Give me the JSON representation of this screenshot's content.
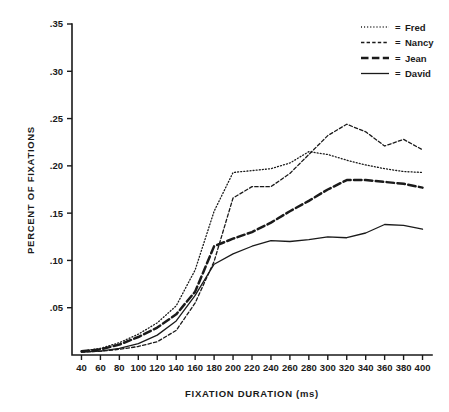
{
  "chart_data": {
    "type": "line",
    "title": "",
    "xlabel": "FIXATION DURATION (ms)",
    "ylabel": "PERCENT OF FIXATIONS",
    "xlim": [
      30,
      410
    ],
    "ylim": [
      0,
      0.35
    ],
    "grid": false,
    "legend_position": "top-right",
    "legend_prefix": "=",
    "x": [
      40,
      60,
      80,
      100,
      120,
      140,
      160,
      180,
      200,
      220,
      240,
      260,
      280,
      300,
      320,
      340,
      360,
      380,
      400
    ],
    "xticks": [
      "40",
      "60",
      "80",
      "100",
      "120",
      "140",
      "160",
      "180",
      "200",
      "220",
      "240",
      "260",
      "280",
      "300",
      "320",
      "340",
      "360",
      "380",
      "400"
    ],
    "yticks": [
      ".05",
      ".10",
      ".15",
      ".20",
      ".25",
      ".30",
      ".35"
    ],
    "ytick_values": [
      0.05,
      0.1,
      0.15,
      0.2,
      0.25,
      0.3,
      0.35
    ],
    "series": [
      {
        "name": "Fred",
        "style": "dotted",
        "values": [
          0.004,
          0.007,
          0.013,
          0.022,
          0.034,
          0.052,
          0.09,
          0.152,
          0.193,
          0.195,
          0.197,
          0.203,
          0.215,
          0.212,
          0.206,
          0.201,
          0.197,
          0.194,
          0.193
        ]
      },
      {
        "name": "Nancy",
        "style": "dashed",
        "values": [
          0.003,
          0.004,
          0.006,
          0.009,
          0.014,
          0.026,
          0.055,
          0.099,
          0.166,
          0.178,
          0.178,
          0.192,
          0.212,
          0.232,
          0.244,
          0.236,
          0.221,
          0.228,
          0.217
        ]
      },
      {
        "name": "Jean",
        "style": "long-dashed",
        "values": [
          0.004,
          0.006,
          0.011,
          0.019,
          0.029,
          0.043,
          0.067,
          0.115,
          0.123,
          0.13,
          0.14,
          0.152,
          0.163,
          0.175,
          0.185,
          0.185,
          0.183,
          0.181,
          0.177
        ]
      },
      {
        "name": "David",
        "style": "solid",
        "values": [
          0.003,
          0.004,
          0.007,
          0.012,
          0.021,
          0.036,
          0.063,
          0.096,
          0.107,
          0.115,
          0.121,
          0.12,
          0.122,
          0.125,
          0.124,
          0.129,
          0.138,
          0.137,
          0.133
        ]
      }
    ]
  }
}
